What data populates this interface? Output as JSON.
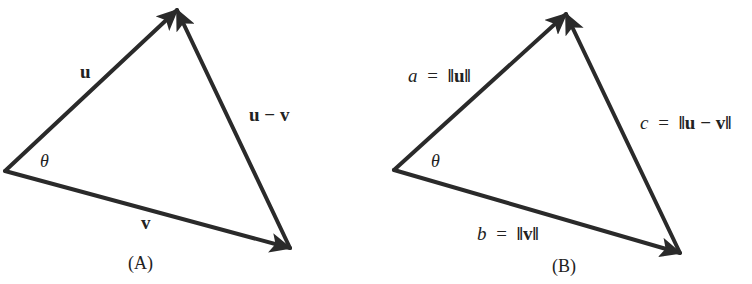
{
  "panels": [
    {
      "id": "A",
      "caption": "(A)",
      "angle_label": "θ",
      "edges": [
        {
          "name": "u",
          "label": "u",
          "from": [
            5,
            171
          ],
          "to": [
            177,
            10
          ]
        },
        {
          "name": "v",
          "label": "v",
          "from": [
            5,
            171
          ],
          "to": [
            290,
            248
          ]
        },
        {
          "name": "u-v",
          "label": "u − v",
          "from": [
            290,
            248
          ],
          "to": [
            177,
            10
          ]
        }
      ]
    },
    {
      "id": "B",
      "caption": "(B)",
      "angle_label": "θ",
      "edges": [
        {
          "name": "a",
          "label_var": "a",
          "label_eq": "=",
          "label_norm": "‖u‖",
          "from": [
            394,
            170
          ],
          "to": [
            566,
            14
          ]
        },
        {
          "name": "b",
          "label_var": "b",
          "label_eq": "=",
          "label_norm": "‖v‖",
          "from": [
            394,
            170
          ],
          "to": [
            680,
            253
          ]
        },
        {
          "name": "c",
          "label_var": "c",
          "label_eq": "=",
          "label_norm": "‖u − v‖",
          "from": [
            680,
            253
          ],
          "to": [
            566,
            14
          ]
        }
      ]
    }
  ],
  "colors": {
    "stroke": "#2a2a2a",
    "text": "#222222",
    "background": "#ffffff"
  }
}
